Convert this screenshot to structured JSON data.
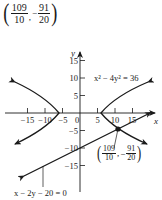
{
  "title_point": {
    "x_num": "109",
    "x_den": "10",
    "y_sign": "−",
    "y_num": "91",
    "y_den": "20",
    "separator": ","
  },
  "graph": {
    "x_axis_label": "x",
    "y_axis_label": "y",
    "x_ticks": [
      {
        "value": -15,
        "label": "−15"
      },
      {
        "value": -10,
        "label": "−10"
      },
      {
        "value": -5,
        "label": "−5"
      },
      {
        "value": 0,
        "label": "0"
      },
      {
        "value": 5,
        "label": "5"
      },
      {
        "value": 10,
        "label": "10"
      },
      {
        "value": 15,
        "label": "15"
      }
    ],
    "y_ticks": [
      {
        "value": 15,
        "label": "15"
      },
      {
        "value": 10,
        "label": "10"
      },
      {
        "value": 5,
        "label": "5"
      },
      {
        "value": -5,
        "label": "−5"
      },
      {
        "value": -10,
        "label": "−10"
      },
      {
        "value": -15,
        "label": "−15"
      }
    ],
    "curves": [
      {
        "name": "hyperbola",
        "equation": "x² − 4y² = 36"
      },
      {
        "name": "line",
        "equation": "x − 2y − 20 = 0"
      }
    ],
    "intersection_point": {
      "x_num": "109",
      "x_den": "10",
      "y_sign": "−",
      "y_num": "91",
      "y_den": "20",
      "separator": ","
    }
  },
  "labels": {
    "hyperbola_eq": "x² − 4y² = 36",
    "line_eq": "x − 2y − 20 = 0"
  }
}
